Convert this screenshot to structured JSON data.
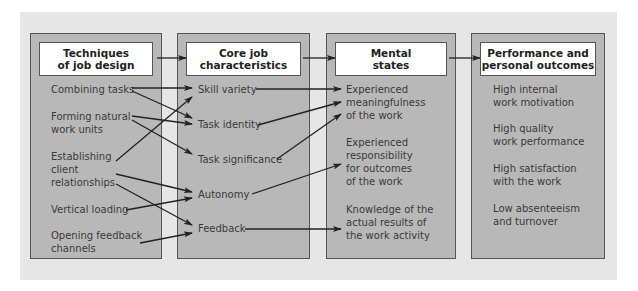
{
  "columns": [
    {
      "header": "Techniques\nof job design",
      "items": [
        "Combining tasks",
        "Forming natural\nwork units",
        "Establishing\nclient\nrelationships",
        "Vertical loading",
        "Opening feedback\nchannels"
      ]
    },
    {
      "header": "Core job\ncharacteristics",
      "items": [
        "Skill variety",
        "Task identity",
        "Task significance",
        "Autonomy",
        "Feedback"
      ]
    },
    {
      "header": "Mental\nstates",
      "items": [
        "Experienced\nmeaningfulness\nof the work",
        "Experienced\nresponsibility\nfor outcomes\nof the work",
        "Knowledge of the\nactual results of\nthe work activity"
      ]
    },
    {
      "header": "Performance and\npersonal outcomes",
      "items": [
        "High internal\nwork motivation",
        "High quality\nwork performance",
        "High satisfaction\nwith the work",
        "Low absenteeism\nand turnover"
      ]
    }
  ],
  "connections": [
    {
      "from": "Combining tasks",
      "to": "Skill variety"
    },
    {
      "from": "Combining tasks",
      "to": "Task identity"
    },
    {
      "from": "Forming natural work units",
      "to": "Task identity"
    },
    {
      "from": "Forming natural work units",
      "to": "Task significance"
    },
    {
      "from": "Establishing client relationships",
      "to": "Skill variety"
    },
    {
      "from": "Establishing client relationships",
      "to": "Autonomy"
    },
    {
      "from": "Establishing client relationships",
      "to": "Feedback"
    },
    {
      "from": "Vertical loading",
      "to": "Autonomy"
    },
    {
      "from": "Opening feedback channels",
      "to": "Feedback"
    },
    {
      "from": "Skill variety",
      "to": "Experienced meaningfulness of the work"
    },
    {
      "from": "Task identity",
      "to": "Experienced meaningfulness of the work"
    },
    {
      "from": "Task significance",
      "to": "Experienced meaningfulness of the work"
    },
    {
      "from": "Autonomy",
      "to": "Experienced responsibility for outcomes of the work"
    },
    {
      "from": "Feedback",
      "to": "Knowledge of the actual results of the work activity"
    }
  ],
  "colors": {
    "panel": "#e6e6e6",
    "column": "#b8b8b8",
    "header": "#ffffff",
    "stroke": "#222222"
  }
}
